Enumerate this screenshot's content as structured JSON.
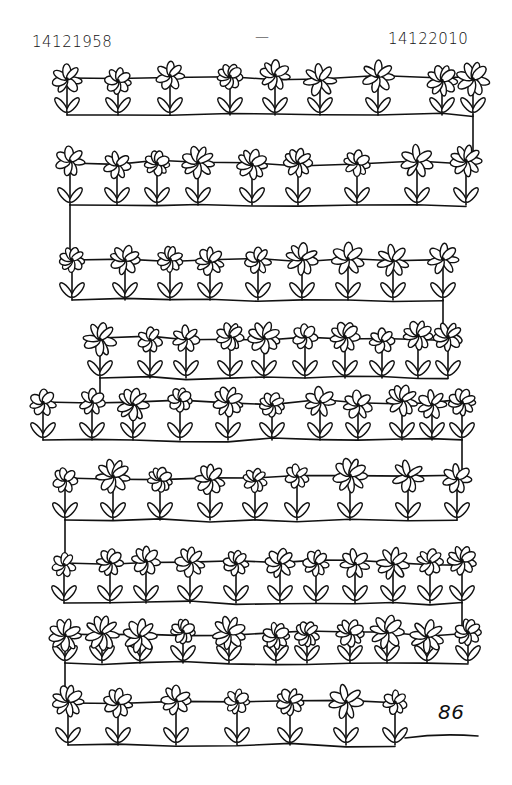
{
  "drawing": {
    "title_start_date": "14121958",
    "title_separator": "—",
    "title_end_date": "14122010",
    "page_number": "86",
    "ink_color": "#111111",
    "paper_color": "#ffffff",
    "rows": [
      {
        "y": 78,
        "ground": 115,
        "xs": [
          67,
          118,
          170,
          230,
          275,
          320,
          378,
          442,
          473
        ]
      },
      {
        "y": 163,
        "ground": 205,
        "xs": [
          70,
          117,
          157,
          198,
          252,
          298,
          357,
          417,
          466
        ]
      },
      {
        "y": 260,
        "ground": 300,
        "xs": [
          72,
          125,
          170,
          210,
          258,
          302,
          348,
          393,
          443
        ]
      },
      {
        "y": 338,
        "ground": 378,
        "xs": [
          100,
          150,
          186,
          230,
          264,
          305,
          345,
          382,
          418,
          448
        ]
      },
      {
        "y": 402,
        "ground": 440,
        "xs": [
          43,
          92,
          133,
          180,
          228,
          272,
          320,
          358,
          402,
          432,
          462
        ]
      },
      {
        "y": 478,
        "ground": 520,
        "xs": [
          65,
          113,
          160,
          210,
          255,
          297,
          350,
          408,
          457
        ]
      },
      {
        "y": 563,
        "ground": 603,
        "xs": [
          64,
          110,
          146,
          190,
          236,
          280,
          316,
          355,
          393,
          430,
          462
        ]
      },
      {
        "y": 634,
        "ground": 663,
        "xs": [
          65,
          102,
          140,
          183,
          229,
          276,
          307,
          350,
          387,
          427,
          468
        ]
      },
      {
        "y": 703,
        "ground": 745,
        "xs": [
          68,
          118,
          176,
          237,
          290,
          346,
          395
        ]
      }
    ]
  }
}
